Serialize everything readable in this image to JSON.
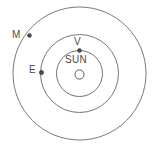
{
  "diagram": {
    "center_label": "SUN",
    "center_symbol": "O",
    "bodies": [
      {
        "key": "mars",
        "label": "M",
        "orbit": "outer",
        "marker": "dot"
      },
      {
        "key": "earth",
        "label": "E",
        "orbit": "middle",
        "marker": "dot"
      },
      {
        "key": "venus",
        "label": "V",
        "orbit": "inner",
        "marker": "dot"
      }
    ],
    "orbits": [
      {
        "key": "inner",
        "name": "venus-orbit"
      },
      {
        "key": "middle",
        "name": "earth-orbit"
      },
      {
        "key": "outer",
        "name": "mars-orbit"
      }
    ],
    "colors": {
      "background": "#ffffff",
      "orbit_stroke": "#6b6b6b",
      "label_text": "#4b4b4b",
      "marker_fill": "#4a4a4a"
    }
  }
}
